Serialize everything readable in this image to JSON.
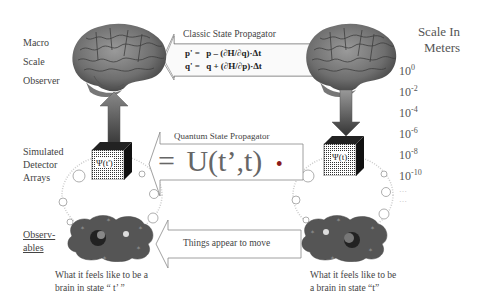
{
  "left_labels": {
    "macro": "Macro",
    "scale": "Scale",
    "observer": "Observer",
    "simulated": "Simulated",
    "detector": "Detector",
    "arrays": "Arrays",
    "observables_1": "Observ-",
    "observables_2": "ables"
  },
  "classic_propagator": {
    "title": "Classic State Propagator",
    "eq1_lhs": "p' =",
    "eq1_rhs": "p – (∂H/∂q)·Δt",
    "eq2_lhs": "q' =",
    "eq2_rhs": "q + (∂H/∂p)·Δt"
  },
  "quantum_propagator": {
    "title": "Quantum State Propagator",
    "equals": "=",
    "operator": "U(t’,t)",
    "dot": "•"
  },
  "things_move": {
    "label": "Things appear to move"
  },
  "cubes": {
    "left_label": "Ψ(t')",
    "right_label": "Ψ(t)"
  },
  "scale": {
    "title_1": "Scale In",
    "title_2": "Meters",
    "items": [
      {
        "base": "10",
        "exp": "0"
      },
      {
        "base": "10",
        "exp": "-2"
      },
      {
        "base": "10",
        "exp": "-4"
      },
      {
        "base": "10",
        "exp": "-6"
      },
      {
        "base": "10",
        "exp": "-8"
      },
      {
        "base": "10",
        "exp": "-10"
      }
    ],
    "ellipsis_1": "…",
    "ellipsis_2": "…"
  },
  "captions": {
    "left_1": "What it feels like to be a",
    "left_2": "brain in state “ t’ ”",
    "right_1": "What it feels like to be",
    "right_2": "a brain in state “t”"
  }
}
